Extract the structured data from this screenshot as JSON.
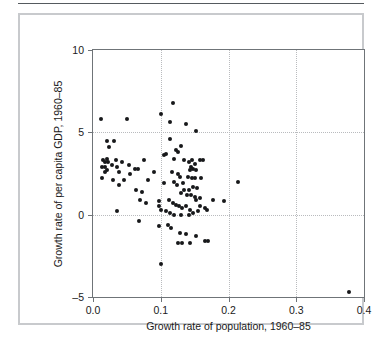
{
  "figure": {
    "border_color": "#c8cacd",
    "rule_color": "#555a5e"
  },
  "chart_data": {
    "type": "scatter",
    "title": "",
    "xlabel": "Growth rate of population, 1960–85",
    "ylabel": "Growth rate of per capita GDP, 1960–85",
    "xlim": [
      0.0,
      0.4
    ],
    "ylim": [
      -5,
      10
    ],
    "xticks": [
      0.0,
      0.1,
      0.2,
      0.3,
      0.4
    ],
    "xticklabels": [
      "0.0",
      "0.1",
      "0.2",
      "0.3",
      "0.4"
    ],
    "yticks": [
      -5,
      0,
      5,
      10
    ],
    "yticklabels": [
      "-5",
      "0",
      "5",
      "10"
    ],
    "grid": true,
    "gridlines_x": [
      0.1,
      0.2,
      0.3
    ],
    "gridlines_y": [
      0,
      5
    ],
    "grid_style": "dotted",
    "grid_color": "#b9bbbe",
    "marker_color": "#17181a",
    "marker_size": 4,
    "legend": null,
    "n_points": 113,
    "points": [
      [
        0.012,
        5.8
      ],
      [
        0.05,
        5.8
      ],
      [
        0.1,
        6.1
      ],
      [
        0.118,
        6.8
      ],
      [
        0.113,
        5.6
      ],
      [
        0.137,
        5.5
      ],
      [
        0.152,
        5.1
      ],
      [
        0.113,
        4.6
      ],
      [
        0.02,
        4.5
      ],
      [
        0.031,
        4.5
      ],
      [
        0.024,
        4.1
      ],
      [
        0.13,
        4.2
      ],
      [
        0.123,
        3.9
      ],
      [
        0.126,
        3.8
      ],
      [
        0.105,
        3.6
      ],
      [
        0.108,
        3.7
      ],
      [
        0.02,
        3.4
      ],
      [
        0.015,
        3.3
      ],
      [
        0.017,
        3.2
      ],
      [
        0.022,
        3.2
      ],
      [
        0.034,
        3.3
      ],
      [
        0.043,
        3.2
      ],
      [
        0.075,
        3.3
      ],
      [
        0.119,
        3.4
      ],
      [
        0.134,
        3.3
      ],
      [
        0.141,
        3.2
      ],
      [
        0.146,
        3.3
      ],
      [
        0.15,
        3.1
      ],
      [
        0.163,
        3.3
      ],
      [
        0.158,
        3.3
      ],
      [
        0.028,
        3.0
      ],
      [
        0.036,
        2.9
      ],
      [
        0.053,
        3.0
      ],
      [
        0.062,
        2.8
      ],
      [
        0.067,
        2.8
      ],
      [
        0.013,
        2.9
      ],
      [
        0.018,
        2.9
      ],
      [
        0.145,
        2.9
      ],
      [
        0.148,
        2.8
      ],
      [
        0.152,
        2.7
      ],
      [
        0.143,
        2.7
      ],
      [
        0.117,
        2.6
      ],
      [
        0.126,
        2.5
      ],
      [
        0.09,
        2.6
      ],
      [
        0.021,
        2.7
      ],
      [
        0.017,
        2.6
      ],
      [
        0.039,
        2.6
      ],
      [
        0.055,
        2.5
      ],
      [
        0.128,
        2.3
      ],
      [
        0.14,
        2.3
      ],
      [
        0.146,
        2.2
      ],
      [
        0.15,
        2.2
      ],
      [
        0.16,
        2.2
      ],
      [
        0.214,
        2.0
      ],
      [
        0.013,
        2.2
      ],
      [
        0.029,
        2.1
      ],
      [
        0.046,
        2.1
      ],
      [
        0.081,
        2.1
      ],
      [
        0.105,
        1.9
      ],
      [
        0.12,
        2.0
      ],
      [
        0.124,
        1.8
      ],
      [
        0.133,
        1.9
      ],
      [
        0.147,
        1.7
      ],
      [
        0.153,
        1.6
      ],
      [
        0.135,
        1.5
      ],
      [
        0.142,
        1.5
      ],
      [
        0.038,
        1.8
      ],
      [
        0.064,
        1.5
      ],
      [
        0.072,
        1.4
      ],
      [
        0.13,
        1.3
      ],
      [
        0.139,
        1.2
      ],
      [
        0.145,
        1.2
      ],
      [
        0.15,
        1.1
      ],
      [
        0.158,
        1.0
      ],
      [
        0.152,
        0.9
      ],
      [
        0.177,
        0.9
      ],
      [
        0.194,
        0.8
      ],
      [
        0.07,
        0.9
      ],
      [
        0.078,
        0.7
      ],
      [
        0.097,
        0.8
      ],
      [
        0.098,
        0.5
      ],
      [
        0.112,
        0.9
      ],
      [
        0.118,
        0.7
      ],
      [
        0.122,
        0.6
      ],
      [
        0.127,
        0.5
      ],
      [
        0.132,
        0.4
      ],
      [
        0.138,
        0.5
      ],
      [
        0.143,
        0.3
      ],
      [
        0.158,
        0.5
      ],
      [
        0.165,
        0.4
      ],
      [
        0.168,
        0.3
      ],
      [
        0.035,
        0.2
      ],
      [
        0.1,
        0.3
      ],
      [
        0.108,
        0.2
      ],
      [
        0.114,
        0.1
      ],
      [
        0.12,
        0.0
      ],
      [
        0.13,
        0.0
      ],
      [
        0.142,
        0.0
      ],
      [
        0.148,
        0.1
      ],
      [
        0.155,
        0.2
      ],
      [
        0.068,
        -0.4
      ],
      [
        0.098,
        -0.7
      ],
      [
        0.11,
        -0.6
      ],
      [
        0.115,
        -0.8
      ],
      [
        0.128,
        -1.1
      ],
      [
        0.137,
        -1.2
      ],
      [
        0.152,
        -1.3
      ],
      [
        0.126,
        -1.7
      ],
      [
        0.132,
        -1.7
      ],
      [
        0.143,
        -1.7
      ],
      [
        0.166,
        -1.6
      ],
      [
        0.17,
        -1.6
      ],
      [
        0.1,
        -3.0
      ],
      [
        0.378,
        -4.7
      ]
    ]
  }
}
